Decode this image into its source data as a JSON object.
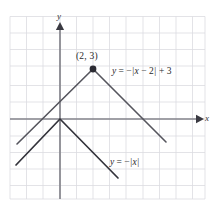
{
  "figure": {
    "type": "graph",
    "background_color": "#ffffff",
    "grid_color": "#d9d9de",
    "axis_color": "#808086",
    "curve_color_primary": "#4a4a52",
    "curve_color_secondary": "#2e2e36",
    "point_color": "#2a2a32"
  },
  "axes": {
    "x_label": "x",
    "y_label": "y",
    "origin_px": [
      60,
      119
    ],
    "unit_px": 16.6,
    "x_range": [
      -3,
      8.7
    ],
    "y_range": [
      -4.8,
      6.2
    ],
    "grid": true,
    "tick_labels": []
  },
  "annotations": {
    "point_label": "(2, 3)",
    "equation_1": "y = -|x - 2| + 3",
    "equation_2": "y = -|x|"
  },
  "chart_data": {
    "type": "line",
    "title": "",
    "xlabel": "x",
    "ylabel": "y",
    "xlim": [
      -3,
      8.7
    ],
    "ylim": [
      -4.8,
      6.2
    ],
    "grid": true,
    "legend": "inline-annotations",
    "series": [
      {
        "name": "y = -|x - 2| + 3",
        "equation": "y = -|x - 2| + 3",
        "vertex": [
          2,
          3
        ],
        "vertex_marked": true,
        "vertex_label": "(2, 3)",
        "points": [
          [
            -0.6,
            0.4
          ],
          [
            2,
            3
          ],
          [
            8.3,
            -3.3
          ]
        ]
      },
      {
        "name": "y = -|x|",
        "equation": "y = -|x|",
        "vertex": [
          0,
          0
        ],
        "vertex_marked": false,
        "points": [
          [
            -2.6,
            -2.6
          ],
          [
            0,
            0
          ],
          [
            3.5,
            -3.5
          ]
        ]
      }
    ]
  }
}
